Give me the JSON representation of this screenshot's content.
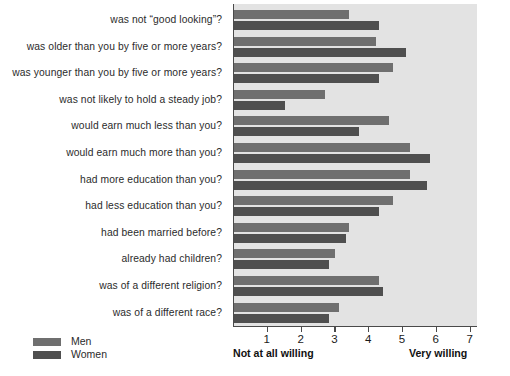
{
  "chart_data": {
    "type": "bar",
    "orientation": "horizontal",
    "title": "",
    "subtitle": "",
    "xlabel": "",
    "ylabel": "",
    "xlim": [
      0,
      7
    ],
    "ylim": null,
    "grid": false,
    "legend_position": "bottom-left",
    "axis_min_caption": "Not at all willing",
    "axis_max_caption": "Very willing",
    "tick_labels": [
      "1",
      "2",
      "3",
      "4",
      "5",
      "6",
      "7"
    ],
    "tick_values": [
      1,
      2,
      3,
      4,
      5,
      6,
      7
    ],
    "categories": [
      "was not “good looking”?",
      "was older than you by five or more years?",
      "was younger than you by five or more years?",
      "was not likely to hold a steady job?",
      "would earn much less than you?",
      "would earn much more than you?",
      "had more education than you?",
      "had less education than you?",
      "had been married before?",
      "already had children?",
      "was of a different religion?",
      "was of a different race?"
    ],
    "series": [
      {
        "name": "Men",
        "color": "#6f6f6f",
        "values": [
          3.4,
          4.2,
          4.7,
          2.7,
          4.6,
          5.2,
          5.2,
          4.7,
          3.4,
          3.0,
          4.3,
          3.1
        ]
      },
      {
        "name": "Women",
        "color": "#4f4f4f",
        "values": [
          4.3,
          5.1,
          4.3,
          1.5,
          3.7,
          5.8,
          5.7,
          4.3,
          3.3,
          2.8,
          4.4,
          2.8
        ]
      }
    ]
  },
  "legend": {
    "items": [
      {
        "label": "Men",
        "color": "#6f6f6f"
      },
      {
        "label": "Women",
        "color": "#4f4f4f"
      }
    ]
  },
  "colors": {
    "plot_background": "#e3e3e3",
    "page_background": "#ffffff",
    "axis": "#4a4a4a",
    "label_text": "#2b2b2b"
  }
}
